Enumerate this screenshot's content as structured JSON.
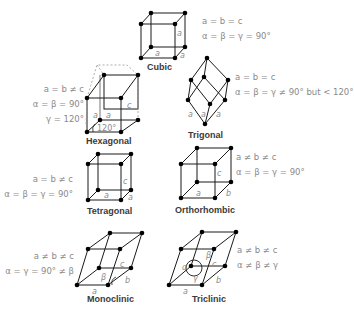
{
  "colors": {
    "line": "#1a1a1a",
    "atom": "#000000",
    "text": "#8a8a8a",
    "label": "#3a3a3a",
    "dashed": "#9a9a9a"
  },
  "systems": [
    {
      "name": "Cubic",
      "edges": "a = b = c",
      "angles": "α = β = γ = 90°",
      "extra": "",
      "edge_labels": [
        "a",
        "a",
        "a"
      ]
    },
    {
      "name": "Hexagonal",
      "edges": "a = b ≠ c",
      "angles": "α = β = 90°",
      "extra": "γ = 120°",
      "edge_labels": [
        "a",
        "a",
        "c",
        "120°"
      ]
    },
    {
      "name": "Trigonal",
      "edges": "a = b = c",
      "angles": "α = β = γ ≠ 90° but < 120°",
      "extra": "",
      "edge_labels": [
        "a",
        "a",
        "a"
      ]
    },
    {
      "name": "Tetragonal",
      "edges": "a = b ≠ c",
      "angles": "α = β = γ = 90°",
      "extra": "",
      "edge_labels": [
        "a",
        "a",
        "c"
      ]
    },
    {
      "name": "Orthorhombic",
      "edges": "a ≠ b ≠ c",
      "angles": "α = β = γ = 90°",
      "extra": "",
      "edge_labels": [
        "a",
        "b",
        "c"
      ]
    },
    {
      "name": "Monoclinic",
      "edges": "a ≠ b ≠ c",
      "angles": "α = γ = 90° ≠ β",
      "extra": "",
      "edge_labels": [
        "a",
        "b",
        "c",
        "β"
      ]
    },
    {
      "name": "Triclinic",
      "edges": "a ≠ b ≠ c",
      "angles": "α ≠ β ≠ γ",
      "extra": "",
      "edge_labels": [
        "a",
        "b",
        "c",
        "α",
        "β",
        "γ"
      ]
    }
  ]
}
